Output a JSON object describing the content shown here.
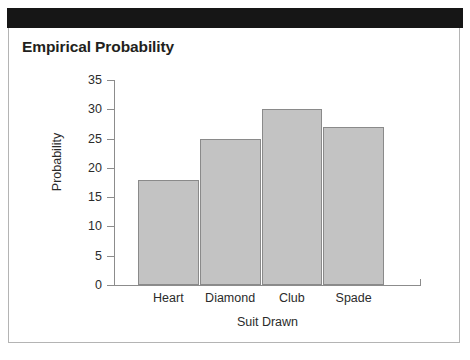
{
  "header": {
    "banner_color": "#161616"
  },
  "panel": {
    "border_color": "#b4b4b4",
    "background": "#ffffff"
  },
  "chart_data": {
    "type": "bar",
    "title": "Empirical Probability",
    "xlabel": "Suit Drawn",
    "ylabel": "Probability",
    "categories": [
      "Heart",
      "Diamond",
      "Club",
      "Spade"
    ],
    "values": [
      18,
      25,
      30,
      27
    ],
    "ylim": [
      0,
      35
    ],
    "yticks": [
      0,
      5,
      10,
      15,
      20,
      25,
      30,
      35
    ],
    "ytick_labels": [
      "0",
      "5",
      "10",
      "15",
      "20",
      "25",
      "30",
      "35"
    ],
    "grid": false,
    "legend": null,
    "bar_fill_color": "#c3c3c3",
    "bar_edge_color": "#8a8a8a",
    "axis_color": "#8c8c8c",
    "text_color": "#2b2b2b"
  }
}
